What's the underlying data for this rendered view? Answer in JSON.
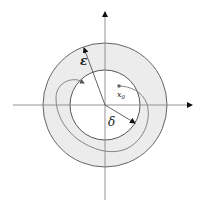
{
  "diagram": {
    "title": "",
    "center": [
      105,
      105
    ],
    "outer_circle": {
      "label": "ε",
      "radius": 62,
      "fill": "#ececec",
      "stroke": "#555555"
    },
    "inner_circle": {
      "label": "δ",
      "radius": 35,
      "fill": "#ffffff",
      "stroke": "#444444"
    },
    "axes": {
      "color": "#888888",
      "arrow_color": "#111111"
    },
    "labels": {
      "epsilon": "ε",
      "delta": "δ",
      "x0_main": "x",
      "x0_sub": "0"
    },
    "initial_point": {
      "name": "x0",
      "position": [
        119,
        86
      ],
      "color": "#666666"
    },
    "trajectory": {
      "color": "#777777"
    }
  }
}
